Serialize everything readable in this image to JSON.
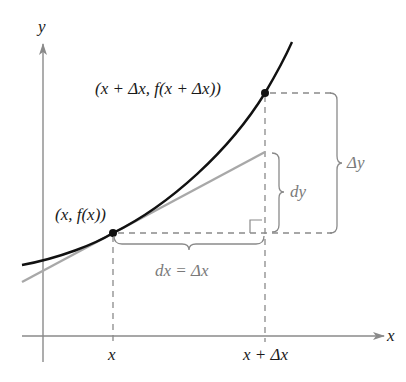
{
  "diagram": {
    "type": "differential-approximation",
    "axes": {
      "x_label": "x",
      "y_label": "y",
      "color": "#8a8a8a"
    },
    "points": [
      {
        "id": "p1",
        "label": "(x, f(x))",
        "label_parts": [
          "(",
          "x",
          ", ",
          "f",
          "(",
          "x",
          "))"
        ]
      },
      {
        "id": "p2",
        "label": "(x + Δx, f(x + Δx))"
      }
    ],
    "tick_labels": {
      "x": "x",
      "x_plus_dx": "x + Δx"
    },
    "annotations": {
      "dx": "dx = Δx",
      "dy": "dy",
      "delta_y": "Δy"
    },
    "colors": {
      "curve": "#111111",
      "tangent": "#a8a8a8",
      "dashed": "#8a8a8a",
      "brace": "#8a8a8a"
    }
  }
}
